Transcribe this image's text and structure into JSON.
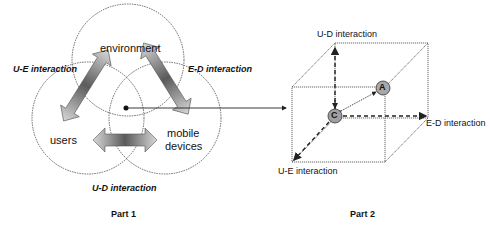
{
  "part1": {
    "caption": "Part 1",
    "circles": {
      "environment": "environment",
      "users": "users",
      "mobile_devices_line1": "mobile",
      "mobile_devices_line2": "devices"
    },
    "interactions": {
      "ue": "U-E interaction",
      "ed": "E-D interaction",
      "ud": "U-D interaction"
    }
  },
  "part2": {
    "caption": "Part 2",
    "axes": {
      "ud": "U-D interaction",
      "ed": "E-D interaction",
      "ue": "U-E interaction"
    },
    "points": {
      "a": "A",
      "c": "C"
    }
  },
  "colors": {
    "line": "#333333",
    "point_fill": "#a0a0a0",
    "arrow_dark": "#555555",
    "arrow_light": "#d8d8d8"
  }
}
